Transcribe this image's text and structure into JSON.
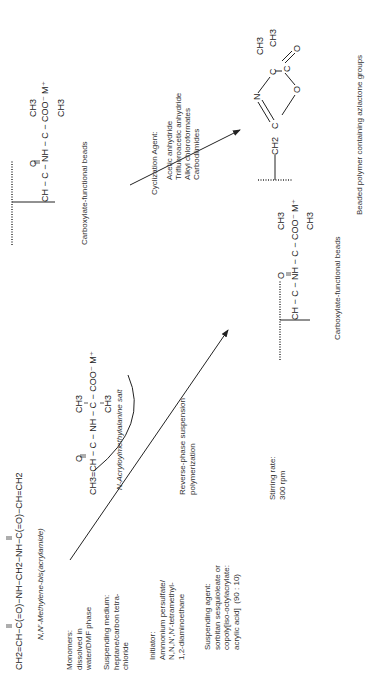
{
  "left_panel": {
    "crosslinker_formula": "CH2=CH−C(=O)−NH−CH2−NH−C(=O)−CH=CH2",
    "crosslinker_name": "N,N′-Methylene-bis(acrylamide)",
    "monomers_label": "Monomers:\ndissolved in\nwater/DMF phase",
    "suspending_medium": "Suspending medium:\nheptane/carbon tetra-\nchloride",
    "initiator": "Initiator:\nAmmonium persulfate/\nN,N,N′,N′-tetramethyl-\n1,2-diaminoethane",
    "suspending_agent": "Suspending agent:\nsorbitan sesquioleate or\ncopoly[iso-octylacrylate:\nacrylic acid]  (90 : 10)",
    "stirring_rate": "Stirring rate:\n300 rpm",
    "monomer_name": "N-Acryloylmethylalanine salt",
    "process_label": "Reverse-phase suspension\npolymerization",
    "product_label": "Carboxylate-functional beads"
  },
  "right_panel": {
    "start_label": "Carboxylate-functional beads",
    "cyclization_title": "Cyclization Agent:",
    "cyclization_agents": [
      "Acetic anhydride",
      "Trifluoroacetic anhydride",
      "Alkyl chloroformates",
      "Carbodiimides"
    ],
    "product_label": "Beaded polymer containing azlactone groups"
  },
  "atoms": {
    "ch": "CH",
    "c": "C",
    "nh": "NH",
    "o": "O",
    "n": "N",
    "ch3": "CH3",
    "ch2": "CH2",
    "coo": "COO⁻ M⁺",
    "ch2eq": "CH2=CH",
    "ch3eq": "CH3=CH"
  },
  "colors": {
    "ink": "#222222",
    "background": "#ffffff"
  }
}
